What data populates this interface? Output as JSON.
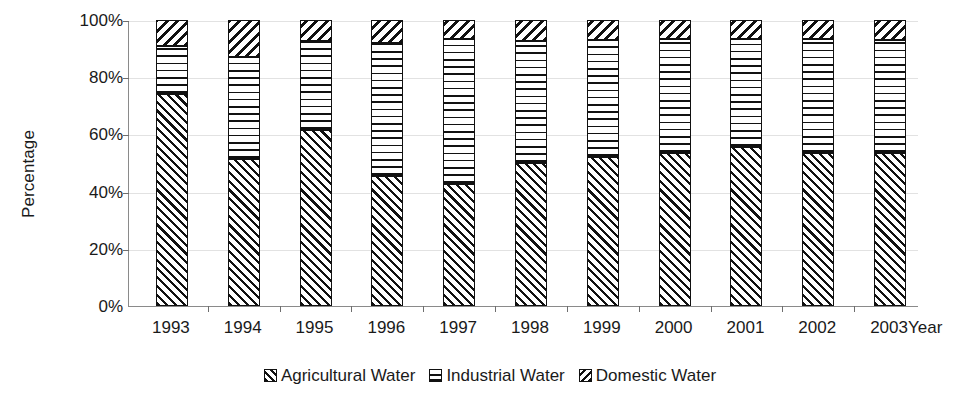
{
  "chart_data": {
    "type": "bar",
    "subtype": "stacked-percentage",
    "title": "",
    "xlabel": "Year",
    "ylabel": "Percentage",
    "categories": [
      "1993",
      "1994",
      "1995",
      "1996",
      "1997",
      "1998",
      "1999",
      "2000",
      "2001",
      "2002",
      "2003"
    ],
    "series": [
      {
        "name": "Agricultural Water",
        "pattern": "diagonal-hatch-forward",
        "values": [
          74,
          51.5,
          61.5,
          45.5,
          42.5,
          50,
          52,
          53.5,
          55.5,
          53.5,
          53.5
        ]
      },
      {
        "name": "Industrial Water",
        "pattern": "horizontal-hatch",
        "values": [
          17,
          35.5,
          31,
          46.5,
          51,
          42.5,
          41,
          40,
          38,
          40,
          39.5
        ]
      },
      {
        "name": "Domestic Water",
        "pattern": "diagonal-hatch-back",
        "values": [
          9,
          13,
          7.5,
          8,
          6.5,
          7.5,
          7,
          6.5,
          6.5,
          6.5,
          7
        ]
      }
    ],
    "ylim": [
      0,
      100
    ],
    "ytick_labels": [
      "0%",
      "20%",
      "40%",
      "60%",
      "80%",
      "100%"
    ],
    "ytick_values": [
      0,
      20,
      40,
      60,
      80,
      100
    ],
    "grid": true,
    "legend_position": "bottom",
    "legend_entries": [
      "Agricultural Water",
      "Industrial Water",
      "Domestic Water"
    ],
    "colors": {
      "line": "#111111",
      "fill": "#ffffff",
      "axis": "#8a8a8a",
      "grid": "#e2e2e2",
      "text": "#1a1a1a"
    }
  }
}
